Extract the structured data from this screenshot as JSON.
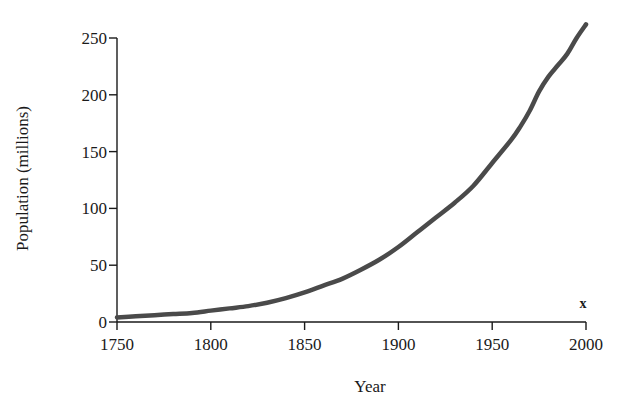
{
  "chart_data": {
    "type": "line",
    "title": "",
    "subtitle": "",
    "xlabel": "Year",
    "ylabel": "Population (millions)",
    "xlim": [
      1750,
      2000
    ],
    "ylim": [
      0,
      250
    ],
    "grid": false,
    "legend": "none",
    "xticks": [
      1750,
      1800,
      1850,
      1900,
      1950,
      2000
    ],
    "xtick_labels": [
      "1750",
      "1800",
      "1850",
      "1900",
      "1950",
      "2000"
    ],
    "yticks": [
      0,
      50,
      100,
      150,
      200,
      250
    ],
    "ytick_labels": [
      "0",
      "50",
      "100",
      "150",
      "200",
      "250"
    ],
    "line_color": "#4a4a4a",
    "line_width": 4.5,
    "axis_color": "#1a1a1a",
    "annotations": [
      {
        "text": "x",
        "x": 2000,
        "y": 18,
        "description": "small x marker above right end of x-axis"
      }
    ],
    "series": [
      {
        "name": "Population",
        "x": [
          1750,
          1760,
          1770,
          1780,
          1790,
          1800,
          1810,
          1820,
          1830,
          1840,
          1850,
          1860,
          1870,
          1880,
          1890,
          1900,
          1910,
          1920,
          1930,
          1940,
          1950,
          1960,
          1965,
          1970,
          1975,
          1980,
          1985,
          1990,
          1995,
          2000
        ],
        "values": [
          4,
          5,
          6,
          7,
          8,
          10,
          12,
          14,
          17,
          21,
          26,
          32,
          38,
          46,
          55,
          66,
          79,
          92,
          105,
          120,
          140,
          160,
          172,
          186,
          203,
          216,
          226,
          236,
          250,
          262
        ]
      }
    ]
  },
  "axis_titles": {
    "x": "Year",
    "y": "Population (millions)"
  },
  "marker": {
    "label": "x"
  }
}
